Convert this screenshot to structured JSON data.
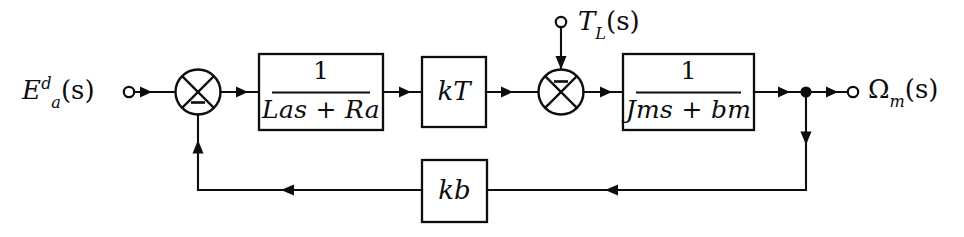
{
  "diagram": {
    "background_color": "#ffffff",
    "line_color": "#0d0d0d",
    "inputs": [
      {
        "id": "armature-voltage",
        "label_html": "E<sup>d</sup><sub>a</sub>(s)",
        "base": "E",
        "superscript": "d",
        "subscript": "a",
        "arg": "(s)",
        "terminal": "open-circle",
        "position": "left"
      },
      {
        "id": "load-torque",
        "label_html": "T<sub>L</sub>(s)",
        "base": "T",
        "subscript": "L",
        "arg": "(s)",
        "terminal": "open-circle",
        "position": "top"
      }
    ],
    "outputs": [
      {
        "id": "motor-speed",
        "label_html": "&Omega;<sub>m</sub>(s)",
        "base": "Ω",
        "subscript": "m",
        "arg": "(s)",
        "terminal": "open-circle",
        "position": "right"
      }
    ],
    "summing_junctions": [
      {
        "id": "summer-1",
        "style": "circle-with-x",
        "sign_position": "bottom",
        "sign": "−",
        "inputs": [
          "armature-voltage",
          "back-emf-feedback"
        ]
      },
      {
        "id": "summer-2",
        "style": "circle-with-x",
        "sign_position": "top",
        "sign": "−",
        "inputs": [
          "torque-signal",
          "load-torque"
        ]
      }
    ],
    "blocks": [
      {
        "id": "electrical-block",
        "kind": "fraction",
        "numerator": "1",
        "denominator": "Lₐs + Rₐ",
        "denominator_parts": {
          "a1": "L",
          "sub1": "a",
          "mid": "s + ",
          "a2": "R",
          "sub2": "a"
        },
        "label_plain": "1/(La s + Ra)"
      },
      {
        "id": "torque-constant-block",
        "kind": "gain",
        "gain_base": "k",
        "gain_sub": "T",
        "label_plain": "kT"
      },
      {
        "id": "mechanical-block",
        "kind": "fraction",
        "numerator": "1",
        "denominator": "Jₘs + bₘ",
        "denominator_parts": {
          "a1": "J",
          "sub1": "m",
          "mid": "s + ",
          "a2": "b",
          "sub2": "m"
        },
        "label_plain": "1/(Jm s + bm)"
      },
      {
        "id": "back-emf-block",
        "kind": "gain",
        "gain_base": "k",
        "gain_sub": "b",
        "label_plain": "kb"
      }
    ],
    "nodes": [
      {
        "id": "output-takeoff",
        "style": "filled-dot"
      }
    ],
    "paths": [
      {
        "id": "forward-path",
        "from": "armature-voltage",
        "to": "motor-speed",
        "direction": "left-to-right"
      },
      {
        "id": "feedback-path",
        "from": "output-takeoff",
        "through": "back-emf-block",
        "to": "summer-1",
        "direction": "right-to-left"
      },
      {
        "id": "disturbance-path",
        "from": "load-torque",
        "to": "summer-2",
        "direction": "top-down"
      }
    ]
  }
}
